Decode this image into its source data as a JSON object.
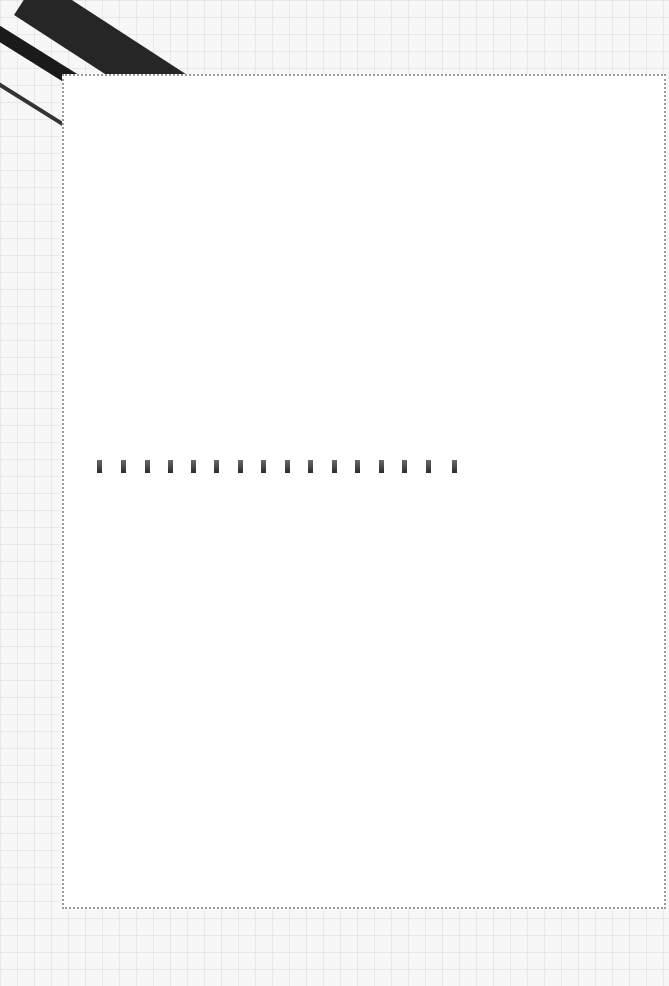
{
  "page": {
    "background": "grid-paper",
    "card_border_color": "#9a9a9a",
    "band_color": "#262626",
    "mark_color": "#2b2b2b"
  },
  "binding_marks": {
    "count": 16,
    "positions_x": [
      0,
      24,
      48,
      71,
      94,
      117,
      141,
      164,
      188,
      211,
      235,
      258,
      282,
      305,
      329,
      355
    ]
  }
}
